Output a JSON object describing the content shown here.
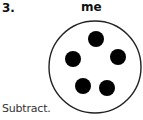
{
  "problem": {
    "number": "3.",
    "header_word": "me",
    "instruction": "Subtract."
  },
  "figure": {
    "type": "circle-with-dots",
    "circle": {
      "cx": 95,
      "cy": 67,
      "r": 46,
      "stroke": "#222222"
    },
    "dot_count": 5,
    "dot_color": "#000000",
    "dots": [
      {
        "cx": 96,
        "cy": 39,
        "r": 8
      },
      {
        "cx": 73,
        "cy": 59,
        "r": 8
      },
      {
        "cx": 118,
        "cy": 57,
        "r": 8
      },
      {
        "cx": 83,
        "cy": 86,
        "r": 8
      },
      {
        "cx": 107,
        "cy": 88,
        "r": 8
      }
    ]
  }
}
